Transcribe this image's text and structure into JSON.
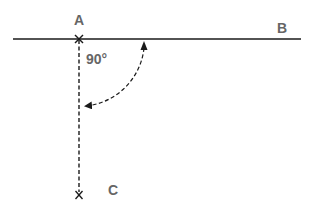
{
  "diagram": {
    "points": {
      "A": {
        "label": "A"
      },
      "B": {
        "label": "B"
      },
      "C": {
        "label": "C"
      }
    },
    "angle": {
      "label": "90°"
    },
    "colors": {
      "line": "#1a1a1a",
      "label": "#666666"
    }
  }
}
